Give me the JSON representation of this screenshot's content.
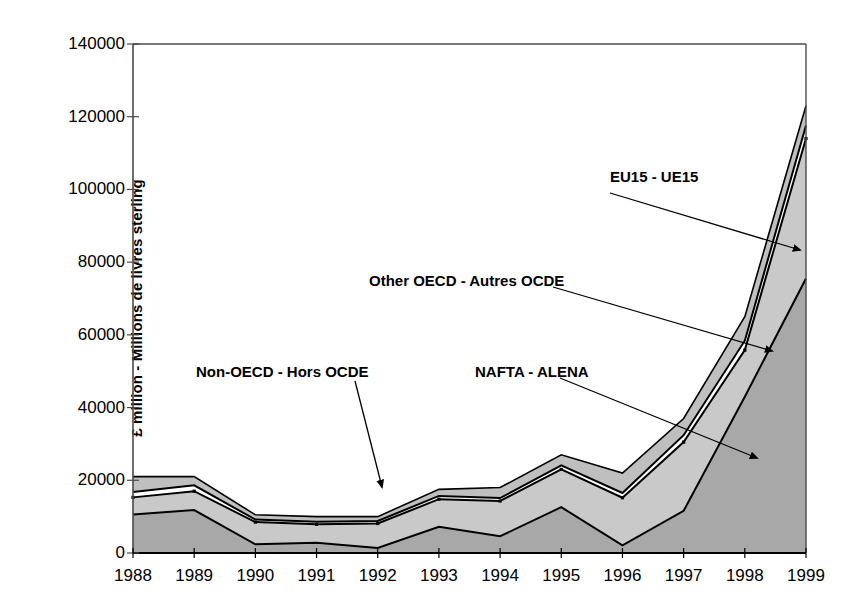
{
  "chart_data": {
    "type": "area",
    "stacked": true,
    "title": "",
    "xlabel": "",
    "ylabel": "£ million - Millions de livres sterling",
    "categories": [
      "1988",
      "1989",
      "1990",
      "1991",
      "1992",
      "1993",
      "1994",
      "1995",
      "1996",
      "1997",
      "1998",
      "1999"
    ],
    "ylim": [
      0,
      140000
    ],
    "yticks": [
      0,
      20000,
      40000,
      60000,
      80000,
      100000,
      120000,
      140000
    ],
    "ytick_labels": [
      "0",
      "20000",
      "40000",
      "60000",
      "80000",
      "100000",
      "120000",
      "140000"
    ],
    "grid": false,
    "legend": "annotations",
    "series": [
      {
        "name": "NAFTA - ALENA",
        "order": 1,
        "fill": "#a8a8a8",
        "values": [
          10600,
          11800,
          2400,
          2800,
          1400,
          7200,
          4600,
          12600,
          2100,
          11600,
          43000,
          75500
        ]
      },
      {
        "name": "Non-OECD - Hors OCDE",
        "order": 2,
        "fill": "#c9c9c9",
        "values": [
          4700,
          5200,
          6100,
          5100,
          6700,
          7600,
          9700,
          10400,
          13100,
          18900,
          12800,
          38500
        ]
      },
      {
        "name": "Other OECD - Autres OCDE",
        "order": 3,
        "fill": "#ffffff",
        "values": [
          1500,
          1600,
          700,
          700,
          700,
          900,
          800,
          1100,
          1300,
          1900,
          2600,
          3600
        ]
      },
      {
        "name": "EU15 - UE15",
        "order": 4,
        "fill": "#bfbfbf",
        "values": [
          4200,
          2400,
          1300,
          1400,
          1200,
          1800,
          2900,
          2900,
          5500,
          4600,
          6600,
          5400
        ]
      }
    ],
    "stacked_totals": [
      21000,
      21000,
      10500,
      10000,
      10000,
      17500,
      18000,
      27000,
      22000,
      37000,
      65000,
      123000
    ],
    "annotations": [
      {
        "text": "EU15 - UE15",
        "label_x": 610,
        "label_y": 168,
        "arrow_from_x": 610,
        "arrow_from_y": 193,
        "arrow_to_x": 800,
        "arrow_to_y": 250
      },
      {
        "text": "Other OECD - Autres OCDE",
        "label_x": 369,
        "label_y": 272,
        "arrow_from_x": 553,
        "arrow_from_y": 287,
        "arrow_to_x": 772,
        "arrow_to_y": 351
      },
      {
        "text": "NAFTA - ALENA",
        "label_x": 475,
        "label_y": 363,
        "arrow_from_x": 560,
        "arrow_from_y": 378,
        "arrow_to_x": 757,
        "arrow_to_y": 458
      },
      {
        "text": "Non-OECD - Hors OCDE",
        "label_x": 196,
        "label_y": 363,
        "arrow_from_x": 355,
        "arrow_from_y": 381,
        "arrow_to_x": 382,
        "arrow_to_y": 487
      }
    ]
  },
  "plot": {
    "left": 133,
    "right": 806,
    "top": 44,
    "bottom": 553
  },
  "colors": {
    "axis": "#4a4a4a",
    "line": "#000000",
    "text": "#000000"
  }
}
